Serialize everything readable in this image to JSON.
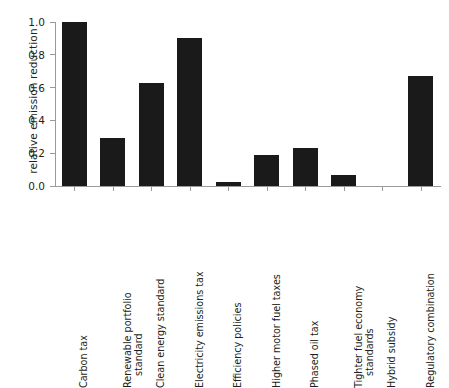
{
  "chart_data": {
    "type": "bar",
    "title": "",
    "xlabel": "",
    "ylabel": "relative emission reduction",
    "ylim": [
      0.0,
      1.0
    ],
    "yticks": [
      "0.0",
      "0.2",
      "0.4",
      "0.6",
      "0.8",
      "1.0"
    ],
    "ytick_values": [
      0.0,
      0.2,
      0.4,
      0.6,
      0.8,
      1.0
    ],
    "grid": false,
    "legend": null,
    "bar_color": "#1a1a1a",
    "axis_color": "#9a9a9a",
    "categories": [
      "Carbon tax",
      "Renewable portfolio standard",
      "Clean energy standard",
      "Electricity emissions tax",
      "Efficiency policies",
      "Higher motor fuel taxes",
      "Phased oil tax",
      "Tighter fuel economy standards",
      "Hybrid subsidy",
      "Regulatory combination"
    ],
    "category_lines": [
      [
        "Carbon tax"
      ],
      [
        "Renewable portfolio",
        "standard"
      ],
      [
        "Clean energy standard"
      ],
      [
        "Electricity emissions tax"
      ],
      [
        "Efficiency policies"
      ],
      [
        "Higher motor fuel taxes"
      ],
      [
        "Phased oil tax"
      ],
      [
        "Tighter fuel economy",
        "standards"
      ],
      [
        "Hybrid subsidy"
      ],
      [
        "Regulatory combination"
      ]
    ],
    "values": [
      1.0,
      0.29,
      0.63,
      0.9,
      0.025,
      0.19,
      0.23,
      0.07,
      0.0,
      0.67
    ]
  }
}
